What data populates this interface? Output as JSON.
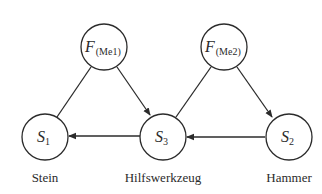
{
  "diagram": {
    "nodes": [
      {
        "id": "F1",
        "main": "F",
        "sub": "(Me1)",
        "caption": ""
      },
      {
        "id": "F2",
        "main": "F",
        "sub": "(Me2)",
        "caption": ""
      },
      {
        "id": "S1",
        "main": "S",
        "sub": "1",
        "caption": "Stein"
      },
      {
        "id": "S3",
        "main": "S",
        "sub": "3",
        "caption": "Hilfswerkzeug"
      },
      {
        "id": "S2",
        "main": "S",
        "sub": "2",
        "caption": "Hammer"
      }
    ],
    "edges": [
      {
        "from": "F1",
        "to": "S1",
        "directed": false
      },
      {
        "from": "F1",
        "to": "S3",
        "directed": true
      },
      {
        "from": "F2",
        "to": "S3",
        "directed": false
      },
      {
        "from": "F2",
        "to": "S2",
        "directed": true
      },
      {
        "from": "S3",
        "to": "S1",
        "directed": true
      },
      {
        "from": "S2",
        "to": "S3",
        "directed": true
      }
    ],
    "colors": {
      "stroke": "#2b2b2b",
      "background": "#ffffff"
    }
  }
}
